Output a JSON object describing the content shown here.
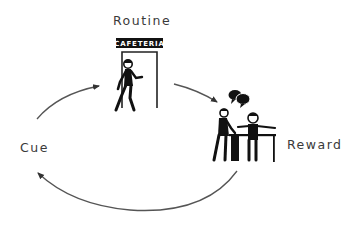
{
  "diagram": {
    "type": "habit-loop",
    "nodes": [
      {
        "id": "routine",
        "label": "Routine",
        "illustration": "person-walking-into-cafeteria"
      },
      {
        "id": "reward",
        "label": "Reward",
        "illustration": "people-chatting-at-table"
      },
      {
        "id": "cue",
        "label": "Cue"
      }
    ],
    "sign": {
      "text": "CAFETERIA"
    },
    "edges": [
      {
        "from": "cue",
        "to": "routine"
      },
      {
        "from": "routine",
        "to": "reward"
      },
      {
        "from": "reward",
        "to": "cue"
      }
    ],
    "colors": {
      "stroke": "#555555",
      "figure": "#111111",
      "text": "#3a3a3a",
      "background": "#ffffff"
    }
  }
}
